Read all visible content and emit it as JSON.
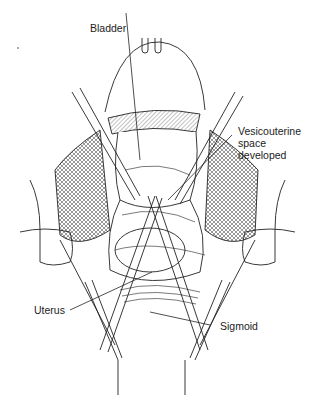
{
  "figure": {
    "type": "surgical line illustration",
    "labels": {
      "bladder": "Bladder",
      "vesico_line1": "Vesicouterine",
      "vesico_line2": "space",
      "vesico_line3": "developed",
      "uterus": "Uterus",
      "sigmoid": "Sigmoid"
    },
    "colors": {
      "ink": "#222222",
      "background": "#ffffff"
    }
  }
}
